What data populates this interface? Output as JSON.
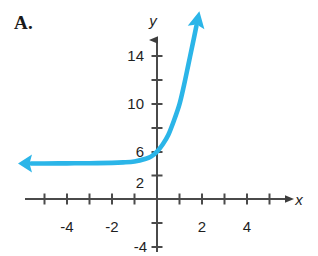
{
  "figure": {
    "problem_label": "A.",
    "background_color": "#ffffff",
    "axis_color": "#4a4a4a",
    "label_color": "#1f1f1f",
    "curve_color": "#2BB5E8"
  },
  "chart_data": {
    "type": "line",
    "title": "",
    "subtitle": "",
    "xlabel": "x",
    "ylabel": "y",
    "xlim": [
      -5.8,
      5.9
    ],
    "ylim": [
      -4.8,
      15.6
    ],
    "grid": false,
    "legend": null,
    "x_ticks_labeled": [
      {
        "value": -4,
        "label": "-4"
      },
      {
        "value": -2,
        "label": "-2"
      },
      {
        "value": 2,
        "label": "2"
      },
      {
        "value": 4,
        "label": "4"
      }
    ],
    "x_ticks_unlabeled": [
      -5,
      -3,
      -1,
      1,
      3,
      5
    ],
    "y_ticks_labeled": [
      {
        "value": 14,
        "label": "14"
      },
      {
        "value": 10,
        "label": "10"
      },
      {
        "value": 6,
        "label": "6"
      },
      {
        "value": 2,
        "label": "2"
      },
      {
        "value": -4,
        "label": "-4"
      }
    ],
    "y_ticks_unlabeled": [
      12,
      8,
      4,
      -2
    ],
    "x_axis_arrow": "right",
    "y_axis_arrow": "up",
    "series": [
      {
        "name": "exponential curve",
        "description": "increasing exponential with horizontal asymptote y = 3",
        "asymptote": 3,
        "y_intercept": 4,
        "arrow_start": "left",
        "arrow_end": "up",
        "color": "#2BB5E8",
        "stroke_width": 4.6,
        "points": [
          {
            "x": -5.6,
            "y": 3.0
          },
          {
            "x": -5.0,
            "y": 3.0
          },
          {
            "x": -4.0,
            "y": 3.01
          },
          {
            "x": -3.0,
            "y": 3.02
          },
          {
            "x": -2.0,
            "y": 3.05
          },
          {
            "x": -1.5,
            "y": 3.09
          },
          {
            "x": -1.0,
            "y": 3.17
          },
          {
            "x": -0.5,
            "y": 3.4
          },
          {
            "x": -0.25,
            "y": 3.6
          },
          {
            "x": 0.0,
            "y": 4.0
          },
          {
            "x": 0.25,
            "y": 4.6
          },
          {
            "x": 0.5,
            "y": 5.4
          },
          {
            "x": 0.75,
            "y": 6.6
          },
          {
            "x": 1.0,
            "y": 8.0
          },
          {
            "x": 1.2,
            "y": 9.6
          },
          {
            "x": 1.4,
            "y": 11.4
          },
          {
            "x": 1.6,
            "y": 13.2
          },
          {
            "x": 1.75,
            "y": 14.6
          }
        ]
      }
    ]
  }
}
